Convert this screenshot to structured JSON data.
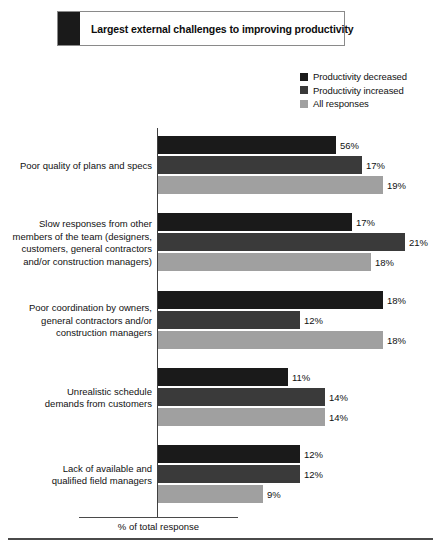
{
  "title": {
    "text": "Largest external challenges to improving productivity",
    "swatch_color": "#1a1a1a"
  },
  "legend": {
    "items": [
      {
        "label": "Productivity decreased",
        "color": "#1a1a1a"
      },
      {
        "label": "Productivity increased",
        "color": "#3a3a3a"
      },
      {
        "label": "All responses",
        "color": "#a0a0a0"
      }
    ]
  },
  "axis": {
    "caption": "% of total response"
  },
  "chart_data": {
    "type": "bar",
    "orientation": "horizontal",
    "title": "Largest external challenges to improving productivity",
    "xlabel": "% of total response",
    "ylabel": "",
    "grid": false,
    "legend_position": "top-right",
    "value_suffix": "%",
    "categories": [
      "Poor quality of plans and specs",
      "Slow responses from other members of the team (designers, customers, general contractors and/or construction managers)",
      "Poor coordination by owners, general contractors and/or construction managers",
      "Unrealistic schedule demands from customers",
      "Lack of available and qualified field managers"
    ],
    "category_lines": [
      [
        "Poor quality of plans and specs"
      ],
      [
        "Slow responses from other",
        "members of the team (designers,",
        "customers, general contractors",
        "and/or construction managers)"
      ],
      [
        "Poor coordination by owners,",
        "general contractors and/or",
        "construction managers"
      ],
      [
        "Unrealistic schedule",
        "demands from customers"
      ],
      [
        "Lack of available and",
        "qualified field managers"
      ]
    ],
    "series": [
      {
        "name": "Productivity decreased",
        "color": "#1a1a1a",
        "values": [
          56,
          17,
          18,
          11,
          12
        ],
        "labels": [
          "56%",
          "17%",
          "18%",
          "11%",
          "12%"
        ],
        "bar_px": [
          178,
          194,
          225,
          130,
          142
        ]
      },
      {
        "name": "Productivity increased",
        "color": "#3a3a3a",
        "values": [
          17,
          21,
          12,
          14,
          12
        ],
        "labels": [
          "17%",
          "21%",
          "12%",
          "14%",
          "12%"
        ],
        "bar_px": [
          204,
          247,
          142,
          167,
          142
        ]
      },
      {
        "name": "All responses",
        "color": "#a0a0a0",
        "values": [
          19,
          18,
          18,
          14,
          9
        ],
        "labels": [
          "19%",
          "18%",
          "18%",
          "14%",
          "9%"
        ],
        "bar_px": [
          225,
          213,
          225,
          167,
          105
        ]
      }
    ],
    "group_tops": [
      136,
      213,
      291,
      368,
      445
    ]
  }
}
